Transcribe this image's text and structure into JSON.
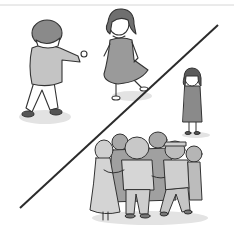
{
  "illustration": {
    "description": "Grayscale cartoon: two children playing together at upper left, a lone child standing apart at right, and a group of children huddled together at lower right, separated by a diagonal line",
    "colors": {
      "background": "#ffffff",
      "outline": "#333333",
      "fill_light": "#d9d9d9",
      "fill_mid": "#b3b3b3",
      "fill_dark": "#8c8c8c",
      "shadow": "#e6e6e6",
      "divider": "#2b2b2b",
      "top_rule": "#d0d0d0"
    }
  }
}
